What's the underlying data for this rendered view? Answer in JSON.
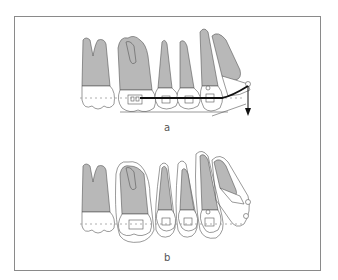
{
  "figure": {
    "panels": [
      {
        "id": "a",
        "label": "a",
        "description": "Upper teeth with bracket, archwire bent with downward extrusion force arrow at anterior tooth"
      },
      {
        "id": "b",
        "label": "b",
        "description": "Upper teeth after movement, outlines showing displaced positions with brackets"
      }
    ],
    "colors": {
      "frame": "#8a8a8a",
      "tooth_fill": "#b8b8b8",
      "outline": "#555555",
      "wire": "#111111",
      "dashed_line": "#9a9a9a"
    }
  }
}
